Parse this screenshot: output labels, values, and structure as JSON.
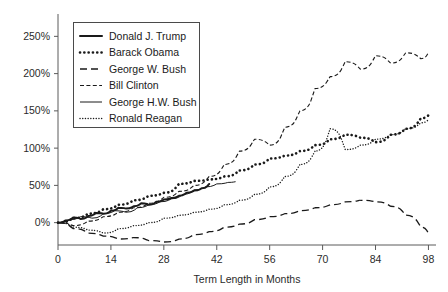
{
  "chart_data": {
    "type": "line",
    "title": "",
    "xlabel": "Term Length in Months",
    "ylabel": "",
    "xlim": [
      0,
      100
    ],
    "ylim": [
      -30,
      280
    ],
    "grid": false,
    "legend_position": "top-left",
    "xticks": [
      "0",
      "14",
      "28",
      "42",
      "56",
      "70",
      "84",
      "98"
    ],
    "xtick_values": [
      0,
      14,
      28,
      42,
      56,
      70,
      84,
      98
    ],
    "yticks": [
      "0%",
      "50%",
      "100%",
      "150%",
      "200%",
      "250%"
    ],
    "ytick_values": [
      0,
      50,
      100,
      150,
      200,
      250
    ],
    "series": [
      {
        "name": "Donald J. Trump",
        "style": "solid-bold",
        "x": [
          0,
          2,
          4,
          6,
          8,
          10,
          12,
          14,
          16,
          18,
          20,
          22,
          24,
          26,
          28,
          30,
          32,
          34,
          36,
          38,
          40
        ],
        "values": [
          0,
          3,
          7,
          5,
          9,
          13,
          12,
          16,
          20,
          19,
          22,
          26,
          24,
          28,
          31,
          33,
          36,
          40,
          43,
          46,
          52
        ]
      },
      {
        "name": "Barack Obama",
        "style": "dotted-bold",
        "x": [
          0,
          4,
          8,
          12,
          16,
          20,
          24,
          28,
          32,
          36,
          40,
          44,
          48,
          52,
          56,
          60,
          64,
          68,
          72,
          76,
          80,
          84,
          88,
          92,
          96,
          98
        ],
        "values": [
          0,
          6,
          12,
          18,
          24,
          30,
          36,
          40,
          52,
          56,
          58,
          62,
          70,
          78,
          86,
          90,
          96,
          104,
          112,
          118,
          114,
          108,
          118,
          126,
          140,
          144
        ]
      },
      {
        "name": "George W. Bush",
        "style": "dashed-long",
        "x": [
          0,
          4,
          8,
          12,
          16,
          20,
          24,
          28,
          32,
          36,
          40,
          44,
          48,
          52,
          56,
          60,
          64,
          68,
          72,
          76,
          80,
          84,
          88,
          92,
          96,
          98
        ],
        "values": [
          0,
          -8,
          -14,
          -18,
          -22,
          -20,
          -24,
          -26,
          -22,
          -16,
          -12,
          -6,
          -2,
          4,
          8,
          12,
          16,
          20,
          24,
          28,
          30,
          28,
          22,
          10,
          -6,
          -14
        ]
      },
      {
        "name": "Bill Clinton",
        "style": "dash-dot-short",
        "x": [
          0,
          4,
          8,
          12,
          16,
          20,
          24,
          28,
          32,
          36,
          40,
          44,
          48,
          52,
          56,
          60,
          64,
          68,
          72,
          76,
          80,
          84,
          88,
          92,
          96,
          98
        ],
        "values": [
          0,
          -4,
          2,
          8,
          14,
          20,
          26,
          34,
          42,
          50,
          62,
          78,
          96,
          112,
          104,
          128,
          150,
          180,
          196,
          216,
          206,
          224,
          214,
          228,
          220,
          228
        ]
      },
      {
        "name": "George H.W. Bush",
        "style": "solid-thin",
        "x": [
          0,
          3,
          6,
          9,
          12,
          15,
          18,
          21,
          24,
          27,
          30,
          33,
          36,
          39,
          42,
          45,
          47
        ],
        "values": [
          0,
          4,
          8,
          6,
          12,
          16,
          14,
          20,
          24,
          28,
          32,
          38,
          44,
          48,
          52,
          54,
          55
        ]
      },
      {
        "name": "Ronald Reagan",
        "style": "dotted-fine",
        "x": [
          0,
          4,
          8,
          12,
          16,
          20,
          24,
          28,
          32,
          36,
          40,
          44,
          48,
          52,
          56,
          60,
          64,
          68,
          72,
          76,
          80,
          84,
          88,
          92,
          96,
          98
        ],
        "values": [
          0,
          -6,
          -10,
          -14,
          -8,
          -4,
          0,
          6,
          10,
          14,
          18,
          24,
          30,
          38,
          48,
          62,
          78,
          96,
          126,
          98,
          104,
          112,
          118,
          126,
          134,
          138
        ]
      }
    ]
  },
  "legend": {
    "items": [
      {
        "label": "Donald J. Trump",
        "style": "solid-bold"
      },
      {
        "label": "Barack Obama",
        "style": "dotted-bold"
      },
      {
        "label": "George W. Bush",
        "style": "dashed-long"
      },
      {
        "label": "Bill Clinton",
        "style": "dash-dot-short"
      },
      {
        "label": "George H.W. Bush",
        "style": "solid-thin"
      },
      {
        "label": "Ronald Reagan",
        "style": "dotted-fine"
      }
    ]
  },
  "axes": {
    "x_title": "Term Length in Months"
  }
}
